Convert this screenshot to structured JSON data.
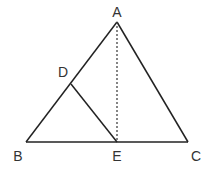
{
  "diagram": {
    "type": "geometry-figure",
    "line_color": "#222222",
    "label_color": "#333333",
    "points": {
      "A": {
        "label": "A",
        "x": 117,
        "y": 22,
        "lx": 117,
        "ly": 12
      },
      "B": {
        "label": "B",
        "x": 26,
        "y": 142,
        "lx": 18,
        "ly": 156
      },
      "C": {
        "label": "C",
        "x": 188,
        "y": 142,
        "lx": 196,
        "ly": 156
      },
      "D": {
        "label": "D",
        "x": 71,
        "y": 84,
        "lx": 63,
        "ly": 72
      },
      "E": {
        "label": "E",
        "x": 117,
        "y": 142,
        "lx": 117,
        "ly": 156
      }
    },
    "segments": [
      {
        "from": "A",
        "to": "B",
        "style": "solid"
      },
      {
        "from": "A",
        "to": "C",
        "style": "solid"
      },
      {
        "from": "B",
        "to": "C",
        "style": "solid"
      },
      {
        "from": "D",
        "to": "E",
        "style": "solid"
      },
      {
        "from": "A",
        "to": "E",
        "style": "dashed"
      }
    ]
  }
}
